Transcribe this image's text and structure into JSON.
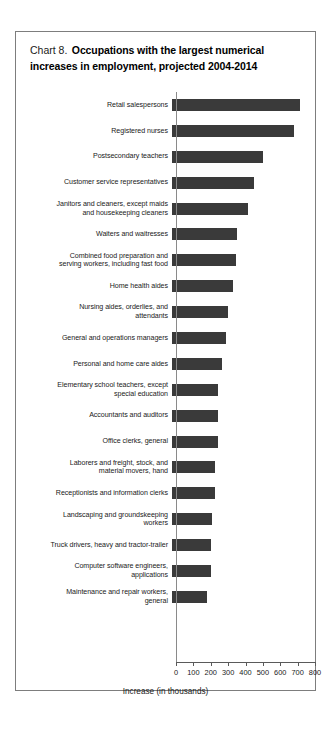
{
  "chart": {
    "title_prefix": "Chart 8.",
    "title_main": "Occupations with the largest numerical increases in employment, projected 2004-2014",
    "title_line1": "Chart 8.",
    "title_line2": "Occupations with the largest numerical",
    "title_line3": "increases in employment, projected 2004-2014",
    "xlabel": "Increase (in thousands)",
    "bar_color": "#3a3a3a",
    "frame_color": "#7d7d7d"
  },
  "chart_data": {
    "type": "bar",
    "orientation": "horizontal",
    "title": "Chart 8. Occupations with the largest numerical increases in employment, projected 2004-2014",
    "xlabel": "Increase (in thousands)",
    "ylabel": "",
    "xlim": [
      0,
      800
    ],
    "xticks": [
      0,
      100,
      200,
      300,
      400,
      500,
      600,
      700,
      800
    ],
    "xtick_labels": [
      "0",
      "100",
      "200",
      "300",
      "400",
      "500",
      "600",
      "700",
      "800"
    ],
    "grid": false,
    "legend": false,
    "categories": [
      "Retail salespersons",
      "Registered nurses",
      "Postsecondary teachers",
      "Customer service representatives",
      "Janitors and cleaners, except maids\nand housekeeping cleaners",
      "Waiters and waitresses",
      "Combined food preparation and\nserving workers, including fast food",
      "Home health aides",
      "Nursing aides, orderlies, and\nattendants",
      "General and operations managers",
      "Personal and home care aides",
      "Elementary school teachers, except\nspecial education",
      "Accountants and auditors",
      "Office clerks, general",
      "Laborers and freight, stock, and\nmaterial movers, hand",
      "Receptionists and information clerks",
      "Landscaping and groundskeeping\nworkers",
      "Truck drivers, heavy and tractor-trailer",
      "Computer software engineers,\napplications",
      "Maintenance and repair workers,\ngeneral"
    ],
    "values": [
      736,
      703,
      524,
      471,
      440,
      376,
      367,
      350,
      325,
      308,
      287,
      265,
      264,
      263,
      248,
      246,
      230,
      223,
      222,
      202
    ]
  }
}
